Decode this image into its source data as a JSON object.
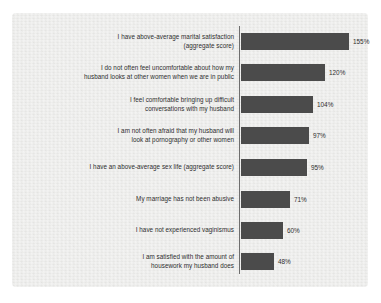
{
  "chart_data": {
    "type": "bar",
    "orientation": "horizontal",
    "title": "",
    "subtitle": "",
    "xlabel": "",
    "ylabel": "",
    "grid": false,
    "legend": null,
    "xlim": [
      0,
      155
    ],
    "value_suffix": "%",
    "categories": [
      "I have above-average marital satisfaction\n(aggregate score)",
      "I do not often feel uncomfortable about how my\nhusband looks at other women when we are in public",
      "I feel comfortable bringing up difficult\nconversations with my husband",
      "I am not often afraid that my husband will\nlook at pornography or other women",
      "I have an above-average sex life  (aggregate score)",
      "My marriage has not been abusive",
      "I have not experienced vaginismus",
      "I am satisfied with the amount of\nhousework my husband does"
    ],
    "values": [
      155,
      120,
      104,
      97,
      95,
      71,
      60,
      48
    ],
    "value_labels": [
      "155%",
      "120%",
      "104%",
      "97%",
      "95%",
      "71%",
      "60%",
      "48%"
    ],
    "series": [
      {
        "name": "",
        "values": [
          155,
          120,
          104,
          97,
          95,
          71,
          60,
          48
        ]
      }
    ]
  },
  "style": {
    "bar_color": "#4b4b4b",
    "panel_background": "#e7e7e5",
    "page_background": "#ffffff",
    "axis_color": "#6e6e6e",
    "text_color": "#2e2e2e"
  },
  "rows": [
    {
      "label": "I have above-average marital satisfaction\n(aggregate score)",
      "value": 155,
      "value_label": "155%"
    },
    {
      "label": "I do not often feel uncomfortable about how my\nhusband looks at other women when we are in public",
      "value": 120,
      "value_label": "120%"
    },
    {
      "label": "I feel comfortable bringing up difficult\nconversations with my husband",
      "value": 104,
      "value_label": "104%"
    },
    {
      "label": "I am not often afraid that my husband will\nlook at pornography or other women",
      "value": 97,
      "value_label": "97%"
    },
    {
      "label": "I have an above-average sex life  (aggregate score)",
      "value": 95,
      "value_label": "95%"
    },
    {
      "label": "My marriage has not been abusive",
      "value": 71,
      "value_label": "71%"
    },
    {
      "label": "I have not experienced vaginismus",
      "value": 60,
      "value_label": "60%"
    },
    {
      "label": "I am satisfied with the amount of\nhousework my husband does",
      "value": 48,
      "value_label": "48%"
    }
  ]
}
